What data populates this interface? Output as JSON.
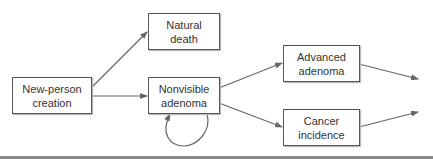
{
  "diagram": {
    "type": "flowchart",
    "nodes": [
      {
        "id": "new_person",
        "label": "New-person\ncreation"
      },
      {
        "id": "natural_death",
        "label": "Natural\ndeath"
      },
      {
        "id": "nonvisible_adenoma",
        "label": "Nonvisible\nadenoma"
      },
      {
        "id": "advanced_adenoma",
        "label": "Advanced\nadenoma"
      },
      {
        "id": "cancer_incidence",
        "label": "Cancer\nincidence"
      }
    ],
    "edges": [
      {
        "from": "new_person",
        "to": "natural_death"
      },
      {
        "from": "new_person",
        "to": "nonvisible_adenoma"
      },
      {
        "from": "nonvisible_adenoma",
        "to": "nonvisible_adenoma",
        "kind": "self-loop"
      },
      {
        "from": "nonvisible_adenoma",
        "to": "advanced_adenoma"
      },
      {
        "from": "nonvisible_adenoma",
        "to": "cancer_incidence"
      },
      {
        "from": "advanced_adenoma",
        "to": "(off-diagram)"
      },
      {
        "from": "cancer_incidence",
        "to": "(off-diagram)"
      }
    ],
    "colors": {
      "line": "#666666",
      "border": "#555555",
      "text": "#333333",
      "divider": "#8a8a8a"
    }
  }
}
